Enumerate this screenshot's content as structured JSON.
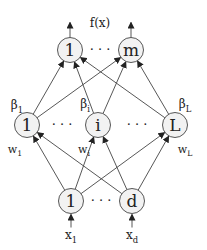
{
  "diagram": {
    "output_label": "f(x)",
    "output_nodes": [
      {
        "id": "o1",
        "label": "1",
        "x": 70,
        "y": 50
      },
      {
        "id": "om",
        "label": "m",
        "x": 131,
        "y": 50
      }
    ],
    "hidden_nodes": [
      {
        "id": "h1",
        "label": "1",
        "x": 27,
        "y": 125,
        "beta": "β",
        "beta_sub": "1",
        "w": "w",
        "w_sub": "1"
      },
      {
        "id": "hi",
        "label": "i",
        "x": 98,
        "y": 125,
        "beta": "β",
        "beta_sub": "i",
        "w": "w",
        "w_sub": "i"
      },
      {
        "id": "hL",
        "label": "L",
        "x": 175,
        "y": 125,
        "beta": "β",
        "beta_sub": "L",
        "w": "w",
        "w_sub": "L"
      }
    ],
    "input_nodes": [
      {
        "id": "i1",
        "label": "1",
        "x": 71,
        "y": 201,
        "input": "x",
        "input_sub": "1"
      },
      {
        "id": "id",
        "label": "d",
        "x": 132,
        "y": 201,
        "input": "x",
        "input_sub": "d"
      }
    ],
    "ellipsis": "· · ·",
    "colors": {
      "stroke": "#444444",
      "node_fill": "#f2f2f2",
      "text": "#222222"
    }
  }
}
